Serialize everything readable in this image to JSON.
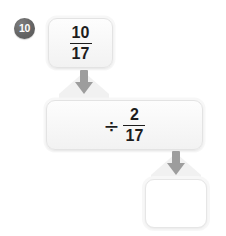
{
  "problem": {
    "number_label": "10",
    "badge_color": "#636363"
  },
  "steps": [
    {
      "role": "dividend",
      "kind": "fraction",
      "operator": "",
      "numerator": "10",
      "denominator": "17"
    },
    {
      "role": "operator",
      "kind": "operation",
      "operator": "÷",
      "numerator": "2",
      "denominator": "17"
    },
    {
      "role": "answer",
      "kind": "blank",
      "operator": "",
      "numerator": "",
      "denominator": "",
      "value": "",
      "placeholder": ""
    }
  ],
  "connectors": [
    {
      "name": "arrow-down-1",
      "icon": "arrow-down-icon",
      "color": "#9a9a9a"
    },
    {
      "name": "arrow-down-2",
      "icon": "arrow-down-icon",
      "color": "#9a9a9a"
    }
  ],
  "theme": {
    "page_background": "#ffffff",
    "tile_fill": "#f7f7f7",
    "tile_border": "#e3e3e3",
    "text_color": "#1d1d1d",
    "arrow_color": "#9a9a9a",
    "chevron_color": "#f0f0f0"
  }
}
